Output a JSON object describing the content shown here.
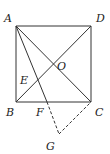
{
  "diagram": {
    "type": "geometry",
    "points": {
      "A": {
        "label": "A",
        "x": 16,
        "y": 26,
        "lx": 4,
        "ly": 22
      },
      "D": {
        "label": "D",
        "x": 91,
        "y": 26,
        "lx": 96,
        "ly": 22
      },
      "B": {
        "label": "B",
        "x": 16,
        "y": 102,
        "lx": 6,
        "ly": 116
      },
      "C": {
        "label": "C",
        "x": 91,
        "y": 102,
        "lx": 95,
        "ly": 116
      },
      "O": {
        "label": "O",
        "x": 53,
        "y": 64,
        "lx": 57,
        "ly": 70
      },
      "E": {
        "label": "E",
        "x": 38,
        "y": 80,
        "lx": 20,
        "ly": 84
      },
      "F": {
        "label": "F",
        "x": 47,
        "y": 102,
        "lx": 36,
        "ly": 116
      },
      "G": {
        "label": "G",
        "x": 59,
        "y": 134,
        "lx": 46,
        "ly": 150
      }
    },
    "solid_segments": [
      "AB",
      "BC",
      "CD",
      "DA",
      "AC",
      "BD",
      "AF"
    ],
    "dashed_segments": [
      "FG",
      "GC"
    ],
    "colors": {
      "line": "#333333",
      "label": "#222222",
      "background": "#ffffff"
    }
  }
}
